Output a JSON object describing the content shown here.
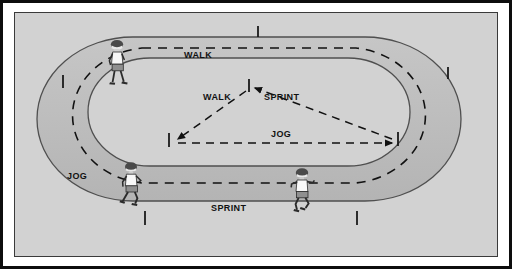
{
  "figure": {
    "kind": "running-track-workout-diagram",
    "background_color": "#d2d2d2",
    "frame_color": "#0d0d0d",
    "ink_color": "#111111"
  },
  "labels": {
    "walk_track": "WALK",
    "walk_triangle": "WALK",
    "sprint_triangle": "SPRINT",
    "jog_triangle": "JOG",
    "jog_track": "JOG",
    "sprint_track": "SPRINT"
  },
  "track": {
    "shape": "oval",
    "lane_band_color": "#bdbdbd",
    "infield_color": "#d2d2d2",
    "outline_color": "#555555",
    "tick_marks": 6
  },
  "paths": [
    {
      "name": "outer-dashed-lap",
      "style": "dashed",
      "color": "#111111"
    },
    {
      "name": "infield-triangle",
      "style": "dashed",
      "color": "#111111",
      "arrowheads": 3
    }
  ],
  "figures": [
    {
      "name": "walker",
      "activity": "WALK",
      "position": "top-left"
    },
    {
      "name": "jogger",
      "activity": "JOG",
      "position": "bottom-left"
    },
    {
      "name": "sprinter",
      "activity": "SPRINT",
      "position": "bottom-right"
    }
  ]
}
